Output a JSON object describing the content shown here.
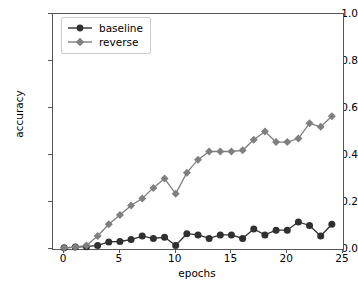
{
  "chart_data": {
    "type": "line",
    "title": "",
    "xlabel": "epochs",
    "ylabel": "accuracy",
    "xlim": [
      -1,
      25
    ],
    "ylim": [
      0.0,
      1.0
    ],
    "xticks": [
      0,
      5,
      10,
      15,
      20,
      25
    ],
    "yticks": [
      "0.0",
      "0.2",
      "0.4",
      "0.6",
      "0.8",
      "1.0"
    ],
    "grid": false,
    "legend_position": "upper left",
    "x": [
      0,
      1,
      2,
      3,
      4,
      5,
      6,
      7,
      8,
      9,
      10,
      11,
      12,
      13,
      14,
      15,
      16,
      17,
      18,
      19,
      20,
      21,
      22,
      23,
      24
    ],
    "series": [
      {
        "name": "baseline",
        "color": "#303030",
        "marker": "circle",
        "values": [
          0.005,
          0.008,
          0.01,
          0.015,
          0.03,
          0.032,
          0.04,
          0.055,
          0.045,
          0.05,
          0.015,
          0.065,
          0.06,
          0.045,
          0.06,
          0.06,
          0.045,
          0.085,
          0.06,
          0.08,
          0.08,
          0.115,
          0.1,
          0.055,
          0.105
        ]
      },
      {
        "name": "reverse",
        "color": "#7f7f7f",
        "marker": "diamond",
        "values": [
          0.005,
          0.008,
          0.015,
          0.055,
          0.105,
          0.145,
          0.185,
          0.215,
          0.26,
          0.3,
          0.235,
          0.325,
          0.38,
          0.415,
          0.415,
          0.415,
          0.42,
          0.465,
          0.5,
          0.455,
          0.455,
          0.47,
          0.535,
          0.52,
          0.565
        ]
      }
    ]
  },
  "legend": {
    "entries": [
      {
        "label": "baseline"
      },
      {
        "label": "reverse"
      }
    ]
  },
  "axes": {
    "ylabel": "accuracy",
    "xlabel": "epochs"
  }
}
